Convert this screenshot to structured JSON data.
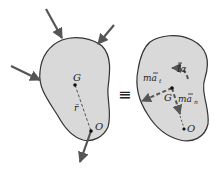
{
  "diagram": {
    "type": "free-body / kinetic diagram equivalence",
    "left_body": {
      "labels": {
        "center_of_mass": "G",
        "pivot": "O",
        "position_vector": "r̄"
      },
      "forces_count": 4
    },
    "equivalence_symbol": "≡",
    "right_body": {
      "labels": {
        "center_of_mass": "G",
        "pivot": "O",
        "moment": "Īα",
        "tangential": "māt",
        "normal": "mān"
      },
      "label_parts": {
        "moment_main": "Iα",
        "tangential_main": "ma",
        "tangential_sub": "t",
        "normal_main": "ma",
        "normal_sub": "n"
      }
    },
    "colors": {
      "body_fill": "#d9d9d9",
      "outline": "#333333",
      "arrow": "#555555",
      "dashed": "#555555"
    }
  }
}
